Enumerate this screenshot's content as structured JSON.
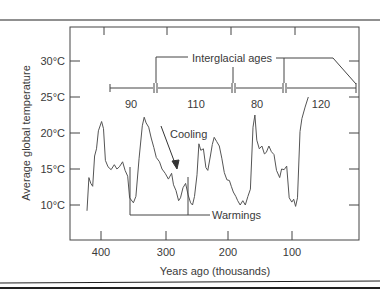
{
  "chart_data": {
    "type": "line",
    "title": "",
    "xlabel": "Years ago (thousands)",
    "ylabel": "Average global temperature",
    "xlim": [
      420,
      0
    ],
    "ylim": [
      6,
      34
    ],
    "x_ticks": [
      400,
      300,
      200,
      100
    ],
    "x_tick_labels": [
      "400",
      "300",
      "200",
      "100"
    ],
    "y_ticks": [
      30,
      25,
      20,
      15,
      10
    ],
    "y_tick_labels": [
      "30°C",
      "25°C",
      "20°C",
      "15°C",
      "10°C"
    ],
    "grid": false,
    "legend": null,
    "series": [
      {
        "name": "Average global temperature",
        "points": [
          [
            423,
            9.2
          ],
          [
            420,
            13.8
          ],
          [
            417,
            13.0
          ],
          [
            414,
            12.6
          ],
          [
            411,
            16.8
          ],
          [
            408,
            17.8
          ],
          [
            405,
            20.3
          ],
          [
            400,
            21.6
          ],
          [
            397,
            20.6
          ],
          [
            394,
            16.2
          ],
          [
            390,
            15.3
          ],
          [
            385,
            14.9
          ],
          [
            380,
            15.6
          ],
          [
            376,
            15.0
          ],
          [
            372,
            15.3
          ],
          [
            367,
            16.0
          ],
          [
            363,
            14.8
          ],
          [
            359,
            14.0
          ],
          [
            356,
            11.0
          ],
          [
            350,
            10.3
          ],
          [
            346,
            11.2
          ],
          [
            341,
            16.5
          ],
          [
            336,
            21.0
          ],
          [
            333,
            22.2
          ],
          [
            330,
            21.4
          ],
          [
            326,
            20.8
          ],
          [
            322,
            19.3
          ],
          [
            318,
            18.0
          ],
          [
            314,
            16.6
          ],
          [
            309,
            16.0
          ],
          [
            305,
            15.0
          ],
          [
            300,
            14.4
          ],
          [
            295,
            13.6
          ],
          [
            290,
            14.4
          ],
          [
            287,
            12.8
          ],
          [
            283,
            12.0
          ],
          [
            279,
            10.6
          ],
          [
            276,
            11.0
          ],
          [
            272,
            12.4
          ],
          [
            268,
            13.0
          ],
          [
            264,
            11.4
          ],
          [
            260,
            10.3
          ],
          [
            257,
            10.0
          ],
          [
            254,
            11.2
          ],
          [
            250,
            14.2
          ],
          [
            247,
            18.5
          ],
          [
            244,
            17.6
          ],
          [
            240,
            17.8
          ],
          [
            236,
            15.2
          ],
          [
            233,
            14.8
          ],
          [
            229,
            16.8
          ],
          [
            226,
            18.4
          ],
          [
            223,
            19.4
          ],
          [
            219,
            18.8
          ],
          [
            215,
            18.2
          ],
          [
            211,
            16.5
          ],
          [
            207,
            14.5
          ],
          [
            203,
            13.5
          ],
          [
            199,
            13.4
          ],
          [
            196,
            12.6
          ],
          [
            193,
            11.8
          ],
          [
            189,
            11.2
          ],
          [
            186,
            10.6
          ],
          [
            182,
            10.0
          ],
          [
            178,
            10.6
          ],
          [
            174,
            10.0
          ],
          [
            170,
            11.2
          ],
          [
            166,
            12.2
          ],
          [
            162,
            20.8
          ],
          [
            159,
            22.5
          ],
          [
            156,
            19.0
          ],
          [
            152,
            17.8
          ],
          [
            148,
            18.2
          ],
          [
            144,
            17.1
          ],
          [
            141,
            17.3
          ],
          [
            137,
            18.2
          ],
          [
            133,
            17.4
          ],
          [
            129,
            17.0
          ],
          [
            125,
            14.8
          ],
          [
            120,
            13.8
          ],
          [
            117,
            15.0
          ],
          [
            113,
            14.9
          ],
          [
            109,
            15.4
          ],
          [
            105,
            11.0
          ],
          [
            101,
            10.4
          ],
          [
            98,
            10.8
          ],
          [
            95,
            9.8
          ],
          [
            92,
            11.0
          ],
          [
            88,
            20.2
          ],
          [
            85,
            22.0
          ],
          [
            80,
            23.6
          ],
          [
            75,
            25.0
          ]
        ]
      }
    ],
    "annotations": [
      {
        "text": "Interglacial ages",
        "type": "bracket-label"
      },
      {
        "text": "Cooling",
        "type": "arrow-label"
      },
      {
        "text": "Warmings",
        "type": "bracket-label"
      }
    ],
    "interglacial_intervals": [
      {
        "label": "90",
        "start": 410,
        "end": 320
      },
      {
        "label": "110",
        "start": 320,
        "end": 210
      },
      {
        "label": "80",
        "start": 210,
        "end": 130
      },
      {
        "label": "120",
        "start": 130,
        "end": 10
      }
    ]
  },
  "labels": {
    "y_axis_title": "Average global temperature",
    "x_axis_title": "Years ago (thousands)",
    "interglacial": "Interglacial ages",
    "cooling": "Cooling",
    "warmings": "Warmings",
    "y_ticks": [
      "30°C",
      "25°C",
      "20°C",
      "15°C",
      "10°C"
    ],
    "x_ticks": [
      "400",
      "300",
      "200",
      "100"
    ],
    "intervals": [
      "90",
      "110",
      "80",
      "120"
    ]
  }
}
